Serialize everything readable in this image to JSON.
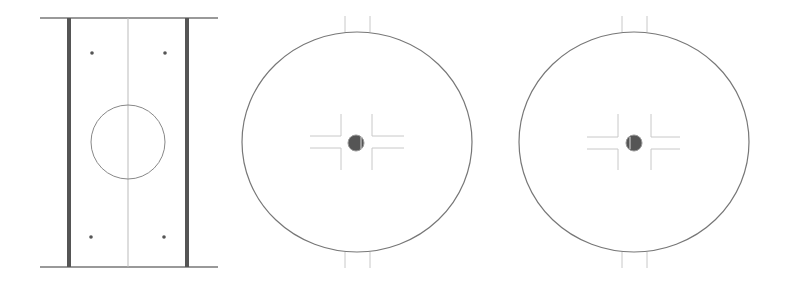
{
  "diagram": {
    "type": "technical-drawing",
    "views": [
      {
        "id": "side-view",
        "description": "Rectangular plate with two thick side rails, centerline, central circle and four mounting dots",
        "rails": [
          {
            "x": 69
          },
          {
            "x": 187
          }
        ],
        "top_line_y": 18,
        "bottom_line_y": 267,
        "line_extent": [
          40,
          218
        ],
        "centerline_x": 128,
        "circle": {
          "cx": 128,
          "cy": 142,
          "r": 37
        },
        "dots": [
          {
            "cx": 92,
            "cy": 53
          },
          {
            "cx": 165,
            "cy": 53
          },
          {
            "cx": 91,
            "cy": 237
          },
          {
            "cx": 164,
            "cy": 237
          }
        ]
      },
      {
        "id": "front-view-1",
        "description": "Large circular disc with top/bottom stubs, cross-shaped slot and central pivot dot",
        "ellipse": {
          "cx": 357,
          "cy": 142,
          "rx": 115,
          "ry": 110
        },
        "stubs_x": [
          345,
          370
        ],
        "cross": {
          "h_y": [
            136,
            148
          ],
          "h_extent": [
            310,
            404
          ],
          "v_x": [
            341,
            372
          ],
          "v_extent": [
            114,
            170
          ]
        },
        "pivot": {
          "cx": 356,
          "cy": 143,
          "r": 8
        }
      },
      {
        "id": "front-view-2",
        "description": "Large circular disc with top/bottom stubs, cross-shaped slot and central pivot dot",
        "ellipse": {
          "cx": 634,
          "cy": 142,
          "rx": 115,
          "ry": 110
        },
        "stubs_x": [
          622,
          647
        ],
        "cross": {
          "h_y": [
            137,
            149
          ],
          "h_extent": [
            587,
            680
          ],
          "v_x": [
            618,
            651
          ],
          "v_extent": [
            114,
            170
          ]
        },
        "pivot": {
          "cx": 634,
          "cy": 143,
          "r": 8
        }
      }
    ],
    "colors": {
      "background": "#ffffff",
      "outline": "#777777",
      "rail": "#555555",
      "thin_line": "#c8c8c8",
      "centerline": "#bbbbbb",
      "dot": "#555555",
      "pivot_fill": "#555555",
      "pivot_ring": "#999999"
    }
  }
}
